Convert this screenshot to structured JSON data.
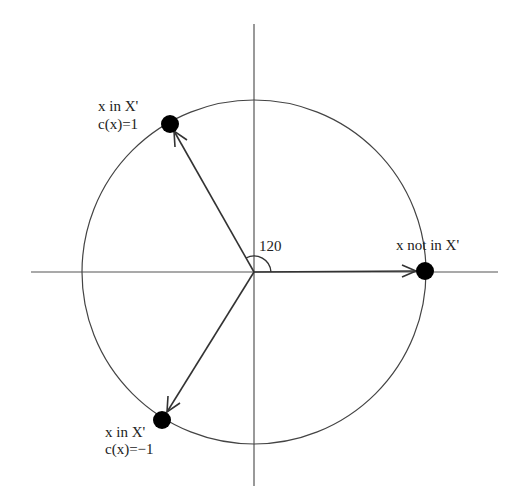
{
  "diagram": {
    "type": "circle-with-vectors",
    "colors": {
      "line": "#555555",
      "arrow": "#333333",
      "point": "#000000",
      "text": "#222222",
      "background": "#ffffff"
    },
    "center": {
      "x": 254,
      "y": 272
    },
    "radius": 172,
    "axes": {
      "horizontal": {
        "x1": 31,
        "x2": 498,
        "y": 272
      },
      "vertical": {
        "x": 254,
        "y1": 24,
        "y2": 486
      }
    },
    "angle_label": "120",
    "points": [
      {
        "id": "top-left",
        "x": 170,
        "y": 124,
        "label_line1": "x in X'",
        "label_line2": "c(x)=1"
      },
      {
        "id": "right",
        "x": 425,
        "y": 271,
        "label_line1": "x not in X'",
        "label_line2": ""
      },
      {
        "id": "bottom-left",
        "x": 162,
        "y": 420,
        "label_line1": "x in X'",
        "label_line2": "c(x)=−1"
      }
    ]
  }
}
